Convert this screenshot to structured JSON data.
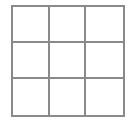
{
  "game": {
    "type": "tic-tac-toe",
    "rows": 3,
    "cols": 3,
    "line_color": "#8a8a8a",
    "cells": [
      "",
      "",
      "",
      "",
      "",
      "",
      "",
      "",
      ""
    ]
  }
}
